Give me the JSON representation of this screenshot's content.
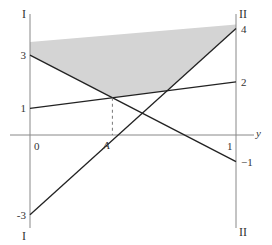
{
  "diagram": {
    "type": "graphical-method",
    "left_axis_label": "I",
    "right_axis_label": "II",
    "h_axis_label": "y",
    "origin_label": "0",
    "one_label": "1",
    "point_label": "A",
    "value_range": [
      -3,
      4.15
    ],
    "lines": [
      {
        "name": "line-3-to-neg1",
        "left": 3,
        "right": -1,
        "left_label": "3",
        "right_label": "−1"
      },
      {
        "name": "line-1-to-2",
        "left": 1,
        "right": 2,
        "left_label": "1",
        "right_label": "2"
      },
      {
        "name": "line-neg3-to-4",
        "left": -3,
        "right": 4,
        "left_label": "-3",
        "right_label": "4"
      }
    ],
    "shaded_top": {
      "left": 3.5,
      "right": 4.15
    },
    "point_A": {
      "y": 0.4,
      "value": 1.4
    },
    "colors": {
      "axis": "#888888",
      "line": "#222222",
      "shade": "#d4d4d4",
      "dash": "#777777"
    }
  }
}
